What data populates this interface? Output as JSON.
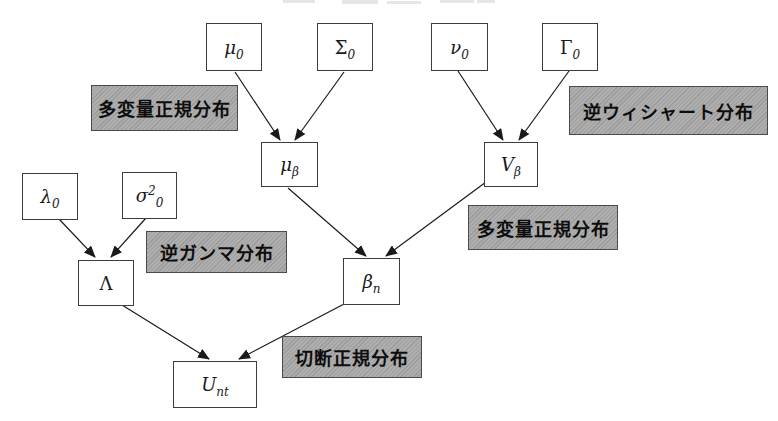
{
  "diagram": {
    "nodes": {
      "mu0": {
        "main": "μ",
        "sup": "",
        "sub": "0"
      },
      "sigma0": {
        "main": "Σ",
        "sup": "",
        "sub": "0"
      },
      "nu0": {
        "main": "ν",
        "sup": "",
        "sub": "0"
      },
      "gamma0": {
        "main": "Γ",
        "sup": "",
        "sub": "0"
      },
      "mu_beta": {
        "main": "μ",
        "sup": "",
        "sub": "β"
      },
      "v_beta": {
        "main": "V",
        "sup": "",
        "sub": "β"
      },
      "lambda0": {
        "main": "λ",
        "sup": "",
        "sub": "0"
      },
      "sigma2_0": {
        "main": "σ",
        "sup": "2",
        "sub": "0"
      },
      "lambda_cap": {
        "main": "Λ",
        "sup": "",
        "sub": ""
      },
      "beta_n": {
        "main": "β",
        "sup": "",
        "sub": "n"
      },
      "u_nt": {
        "main": "U",
        "sup": "",
        "sub": "nt"
      }
    },
    "labels": {
      "multivariate_normal_top": "多変量正規分布",
      "inverse_wishart": "逆ウィシャート分布",
      "inverse_gamma": "逆ガンマ分布",
      "multivariate_normal_mid": "多変量正規分布",
      "truncated_normal": "切断正規分布"
    },
    "edges": [
      {
        "from": "mu0",
        "to": "mu_beta"
      },
      {
        "from": "sigma0",
        "to": "mu_beta"
      },
      {
        "from": "nu0",
        "to": "v_beta"
      },
      {
        "from": "gamma0",
        "to": "v_beta"
      },
      {
        "from": "mu_beta",
        "to": "beta_n"
      },
      {
        "from": "v_beta",
        "to": "beta_n"
      },
      {
        "from": "lambda0",
        "to": "lambda_cap"
      },
      {
        "from": "sigma2_0",
        "to": "lambda_cap"
      },
      {
        "from": "lambda_cap",
        "to": "u_nt"
      },
      {
        "from": "beta_n",
        "to": "u_nt"
      }
    ]
  },
  "colors": {
    "background": "#ffffff",
    "node_fill": "#ffffff",
    "node_border": "#3d3d3d",
    "label_background": "#a9a9a9",
    "label_border": "#4a4a4a",
    "label_text": "#0d0d0d",
    "arrow": "#1a1a1a"
  }
}
